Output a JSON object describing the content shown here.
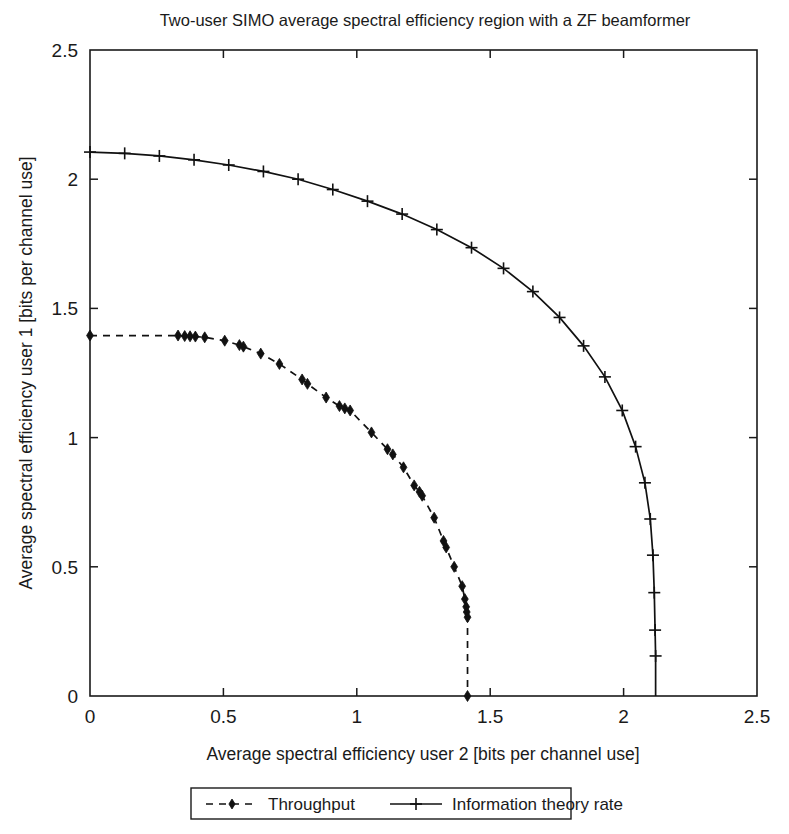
{
  "chart_data": {
    "type": "line",
    "title": "Two-user SIMO average spectral efficiency region with a ZF beamformer",
    "xlabel": "Average spectral efficiency user 2 [bits per channel use]",
    "ylabel": "Average spectral efficiency user 1 [bits per channel use]",
    "xlim": [
      0,
      2.5
    ],
    "ylim": [
      0,
      2.5
    ],
    "xticks": [
      0,
      0.5,
      1,
      1.5,
      2,
      2.5
    ],
    "yticks": [
      0,
      0.5,
      1,
      1.5,
      2,
      2.5
    ],
    "xtick_labels": [
      "0",
      "0.5",
      "1",
      "1.5",
      "2",
      "2.5"
    ],
    "ytick_labels": [
      "0",
      "0.5",
      "1",
      "1.5",
      "2",
      "2.5"
    ],
    "grid": false,
    "legend_position": "below-axes-outside",
    "series": [
      {
        "name": "Throughput",
        "line_style": "dashed",
        "marker": "diamond",
        "color": "#111111",
        "points": [
          [
            0.0,
            1.395
          ],
          [
            0.33,
            1.395
          ],
          [
            0.355,
            1.393
          ],
          [
            0.375,
            1.392
          ],
          [
            0.395,
            1.391
          ],
          [
            0.43,
            1.388
          ],
          [
            0.505,
            1.375
          ],
          [
            0.56,
            1.358
          ],
          [
            0.575,
            1.352
          ],
          [
            0.64,
            1.325
          ],
          [
            0.71,
            1.285
          ],
          [
            0.795,
            1.225
          ],
          [
            0.815,
            1.208
          ],
          [
            0.885,
            1.155
          ],
          [
            0.935,
            1.122
          ],
          [
            0.955,
            1.113
          ],
          [
            0.975,
            1.105
          ],
          [
            1.055,
            1.02
          ],
          [
            1.115,
            0.955
          ],
          [
            1.135,
            0.935
          ],
          [
            1.175,
            0.885
          ],
          [
            1.215,
            0.815
          ],
          [
            1.235,
            0.79
          ],
          [
            1.245,
            0.775
          ],
          [
            1.29,
            0.69
          ],
          [
            1.325,
            0.6
          ],
          [
            1.335,
            0.575
          ],
          [
            1.365,
            0.5
          ],
          [
            1.395,
            0.425
          ],
          [
            1.405,
            0.375
          ],
          [
            1.41,
            0.345
          ],
          [
            1.412,
            0.325
          ],
          [
            1.415,
            0.305
          ],
          [
            1.415,
            0.0
          ]
        ]
      },
      {
        "name": "Information theory rate",
        "line_style": "solid",
        "marker": "plus",
        "color": "#111111",
        "points": [
          [
            0.0,
            2.105
          ],
          [
            0.13,
            2.1
          ],
          [
            0.26,
            2.09
          ],
          [
            0.39,
            2.075
          ],
          [
            0.52,
            2.055
          ],
          [
            0.65,
            2.03
          ],
          [
            0.78,
            2.0
          ],
          [
            0.91,
            1.96
          ],
          [
            1.04,
            1.915
          ],
          [
            1.17,
            1.865
          ],
          [
            1.3,
            1.805
          ],
          [
            1.43,
            1.735
          ],
          [
            1.55,
            1.655
          ],
          [
            1.66,
            1.565
          ],
          [
            1.76,
            1.465
          ],
          [
            1.85,
            1.355
          ],
          [
            1.93,
            1.235
          ],
          [
            1.995,
            1.105
          ],
          [
            2.045,
            0.965
          ],
          [
            2.08,
            0.825
          ],
          [
            2.1,
            0.685
          ],
          [
            2.11,
            0.545
          ],
          [
            2.115,
            0.4
          ],
          [
            2.118,
            0.255
          ],
          [
            2.12,
            0.155
          ],
          [
            2.12,
            0.0
          ]
        ]
      }
    ],
    "legend_entries": [
      {
        "label": "Throughput",
        "line_style": "dashed",
        "marker": "diamond"
      },
      {
        "label": "Information theory rate",
        "line_style": "solid",
        "marker": "plus"
      }
    ]
  }
}
